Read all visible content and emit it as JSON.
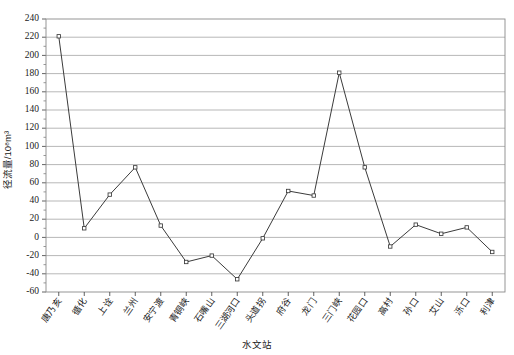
{
  "chart_data": {
    "type": "line",
    "title": "",
    "xlabel": "水文站",
    "ylabel": "径流量/10⁸m³",
    "ylim": [
      -60,
      240
    ],
    "ytick_step": 20,
    "grid": true,
    "legend": "none",
    "marker": "open-square",
    "categories": [
      "唐乃亥",
      "循化",
      "上诠",
      "兰州",
      "安宁渡",
      "青铜峡",
      "石嘴山",
      "三湖河口",
      "头道拐",
      "府谷",
      "龙门",
      "三门峡",
      "花园口",
      "高村",
      "孙口",
      "艾山",
      "泺口",
      "利津"
    ],
    "values": [
      221,
      10,
      47,
      77,
      13,
      -27,
      -20,
      -46,
      -1,
      51,
      46,
      181,
      77,
      -10,
      14,
      4,
      11,
      -16
    ],
    "ytick_labels": [
      "240",
      "220",
      "200",
      "180",
      "160",
      "140",
      "120",
      "100",
      "80",
      "60",
      "40",
      "20",
      "0",
      "-20",
      "-40",
      "-60"
    ],
    "ytick_values": [
      240,
      220,
      200,
      180,
      160,
      140,
      120,
      100,
      80,
      60,
      40,
      20,
      0,
      -20,
      -40,
      -60
    ],
    "series": [
      {
        "name": "径流量",
        "values": [
          221,
          10,
          47,
          77,
          13,
          -27,
          -20,
          -46,
          -1,
          51,
          46,
          181,
          77,
          -10,
          14,
          4,
          11,
          -16
        ]
      }
    ],
    "colors": {
      "line": "#3b3b3b",
      "marker_fill": "#ffffff",
      "marker_stroke": "#3b3b3b",
      "gridline": "#9a9a9a",
      "frame": "#8a8a8a",
      "text": "#1a1a1a",
      "background": "#ffffff"
    }
  }
}
